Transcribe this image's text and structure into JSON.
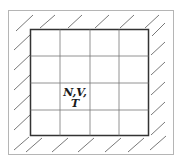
{
  "diagram": {
    "type": "thermodynamic-system-grid",
    "label_line1": "N,V,",
    "label_line2": "T",
    "grid": {
      "rows": 4,
      "cols": 4
    },
    "colors": {
      "outer_frame": "#b5b5b5",
      "box_border": "#333333",
      "grid_lines": "#777777",
      "hatch": "#555555",
      "text": "#1a1a1a"
    }
  }
}
